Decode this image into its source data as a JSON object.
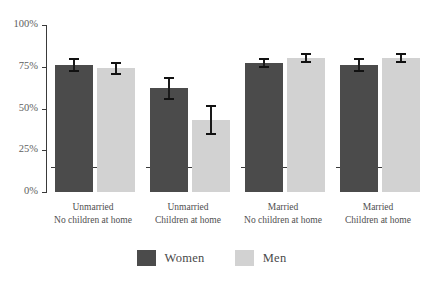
{
  "chart_data": {
    "type": "bar",
    "title": "",
    "xlabel": "",
    "ylabel": "",
    "ylim": [
      0,
      100
    ],
    "ytick_values": [
      0,
      25,
      50,
      75,
      100
    ],
    "ytick_labels": [
      "0%",
      "25%",
      "50%",
      "75%",
      "100%"
    ],
    "grid": false,
    "legend_position": "bottom-center",
    "categories": [
      "Unmarried No children at home",
      "Unmarried Children at home",
      "Married No children at home",
      "Married Children at home"
    ],
    "category_lines": [
      {
        "line1": "Unmarried",
        "line2": "No children at home"
      },
      {
        "line1": "Unmarried",
        "line2": "Children at home"
      },
      {
        "line1": "Married",
        "line2": "No children at home"
      },
      {
        "line1": "Married",
        "line2": "Children at home"
      }
    ],
    "series": [
      {
        "name": "Women",
        "color": "#4b4b4b",
        "values": [
          76,
          62,
          77,
          76
        ],
        "err_low": [
          72,
          55,
          74,
          72
        ],
        "err_high": [
          80,
          69,
          80,
          80
        ]
      },
      {
        "name": "Men",
        "color": "#d2d2d2",
        "values": [
          74,
          43,
          80,
          80
        ],
        "err_low": [
          70,
          34,
          77,
          77
        ],
        "err_high": [
          78,
          52,
          83,
          83
        ]
      }
    ]
  },
  "legend": {
    "items": [
      {
        "label": "Women",
        "color": "#4b4b4b"
      },
      {
        "label": "Men",
        "color": "#d2d2d2"
      }
    ]
  },
  "colors": {
    "women": "#4b4b4b",
    "men": "#d2d2d2",
    "axis": "#3a3a3a",
    "text": "#4f4f4f",
    "background": "#ffffff"
  },
  "title_strip": ""
}
